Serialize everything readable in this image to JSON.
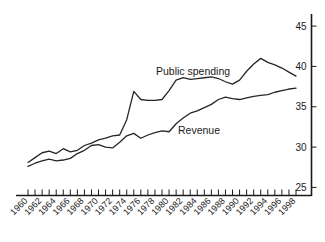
{
  "chart_data": {
    "type": "line",
    "title": "",
    "subtitle": "",
    "xlabel": "",
    "ylabel": "",
    "xlim": [
      1960,
      1998
    ],
    "ylim": [
      24.0,
      46.5
    ],
    "grid": false,
    "legend_position": "inline-annotations",
    "y_ticks": [
      25,
      30,
      35,
      40,
      45
    ],
    "y_tick_labels": [
      "25",
      "30",
      "35",
      "40",
      "45"
    ],
    "y_axis_side": "right",
    "x": [
      1960,
      1961,
      1962,
      1963,
      1964,
      1965,
      1966,
      1967,
      1968,
      1969,
      1970,
      1971,
      1972,
      1973,
      1974,
      1975,
      1976,
      1977,
      1978,
      1979,
      1980,
      1981,
      1982,
      1983,
      1984,
      1985,
      1986,
      1987,
      1988,
      1989,
      1990,
      1991,
      1992,
      1993,
      1994,
      1995,
      1996,
      1997,
      1998
    ],
    "x_tick_labels": [
      "1960",
      "1962",
      "1964",
      "1966",
      "1968",
      "1970",
      "1972",
      "1974",
      "1976",
      "1978",
      "1980",
      "1982",
      "1984",
      "1986",
      "1988",
      "1990",
      "1992",
      "1994",
      "1996",
      "1998"
    ],
    "x_tick_label_rotation": -45,
    "x_minor_ticks_every": 1,
    "series": [
      {
        "name": "Public spending",
        "label_text": "Public spending",
        "values": [
          28.1,
          28.7,
          29.3,
          29.5,
          29.2,
          29.8,
          29.4,
          29.6,
          30.2,
          30.5,
          30.9,
          31.1,
          31.4,
          31.5,
          33.4,
          36.9,
          35.9,
          35.8,
          35.8,
          35.9,
          37.0,
          38.3,
          38.6,
          38.4,
          38.5,
          38.6,
          38.7,
          38.5,
          38.1,
          37.8,
          38.3,
          39.4,
          40.3,
          41.0,
          40.5,
          40.2,
          39.8,
          39.3,
          38.8
        ]
      },
      {
        "name": "Revenue",
        "label_text": "Revenue",
        "values": [
          27.6,
          28.0,
          28.3,
          28.5,
          28.3,
          28.4,
          28.6,
          29.2,
          29.6,
          30.2,
          30.3,
          30.0,
          29.9,
          30.6,
          31.4,
          31.7,
          31.1,
          31.5,
          31.8,
          32.0,
          31.9,
          32.9,
          33.6,
          34.2,
          34.5,
          34.9,
          35.3,
          35.9,
          36.2,
          36.0,
          35.9,
          36.1,
          36.3,
          36.4,
          36.5,
          36.8,
          37.0,
          37.2,
          37.3
        ]
      }
    ],
    "annotations": [
      {
        "text": "Public spending",
        "x_px": 156,
        "y_px": 75
      },
      {
        "text": "Revenue",
        "x_px": 178,
        "y_px": 134
      }
    ],
    "colors": {
      "line": "#262626",
      "axis": "#1a1a1a",
      "background": "#ffffff",
      "text": "#1a1a1a"
    }
  }
}
